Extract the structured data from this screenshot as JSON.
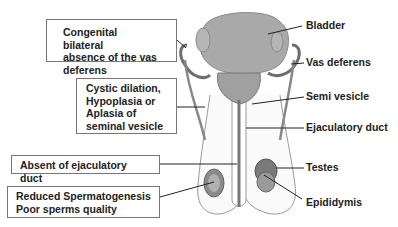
{
  "diagram": {
    "left_boxes": [
      {
        "text": "Congenital bilateral absence of the vas deferens",
        "lines": [
          "Congenital bilateral",
          "absence of the vas",
          "deferens"
        ]
      },
      {
        "text": "Cystic dilation, Hypoplasia or Aplasia of seminal vesicle",
        "lines": [
          "Cystic dilation,",
          "Hypoplasia or",
          "Aplasia of",
          "seminal vesicle"
        ]
      },
      {
        "text": "Absent of ejaculatory duct",
        "lines": [
          "Absent of ejaculatory duct"
        ]
      },
      {
        "text": "Reduced Spermatogenesis Poor sperms quality",
        "lines": [
          "Reduced Spermatogenesis",
          "Poor sperms quality"
        ]
      }
    ],
    "right_labels": [
      {
        "text": "Bladder"
      },
      {
        "text": "Vas deferens"
      },
      {
        "text": "Semi vesicle"
      },
      {
        "text": "Ejaculatory duct"
      },
      {
        "text": "Testes"
      },
      {
        "text": "Epididymis"
      }
    ],
    "colors": {
      "organ_fill": "#a9a9a9",
      "organ_stroke": "#6e6e6e",
      "line": "#222222",
      "box_border": "#777777"
    }
  }
}
